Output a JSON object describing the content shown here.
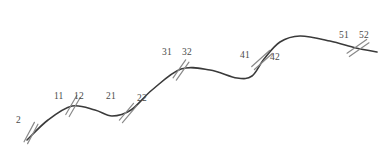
{
  "figure": {
    "type": "curve-diagram",
    "background_color": "#ffffff",
    "curve_color": "#3a3a3a",
    "tick_color": "#8a8a8a",
    "label_color": "#4a4a4a",
    "width": 387,
    "height": 161
  },
  "chart_data": {
    "type": "line",
    "title": "",
    "xlabel": "",
    "ylabel": "",
    "grid": false,
    "legend": null,
    "curve_points": [
      [
        27,
        140
      ],
      [
        48,
        120
      ],
      [
        72,
        106
      ],
      [
        95,
        110
      ],
      [
        112,
        116
      ],
      [
        131,
        110
      ],
      [
        152,
        90
      ],
      [
        181,
        69
      ],
      [
        210,
        70
      ],
      [
        237,
        78
      ],
      [
        252,
        76
      ],
      [
        264,
        59
      ],
      [
        280,
        42
      ],
      [
        300,
        36
      ],
      [
        330,
        41
      ],
      [
        356,
        48
      ],
      [
        377,
        52
      ]
    ],
    "tick_marks": [
      {
        "id": "tick-2",
        "x": 31,
        "y": 133,
        "angle_deg": 62,
        "length": 22,
        "pair_gap": 4
      },
      {
        "id": "tick-1x",
        "x": 73,
        "y": 106,
        "angle_deg": 60,
        "length": 22,
        "pair_gap": 4
      },
      {
        "id": "tick-2x",
        "x": 128,
        "y": 113,
        "angle_deg": 50,
        "length": 22,
        "pair_gap": 4
      },
      {
        "id": "tick-3x",
        "x": 181,
        "y": 70,
        "angle_deg": 55,
        "length": 22,
        "pair_gap": 4
      },
      {
        "id": "tick-4x",
        "x": 262,
        "y": 60,
        "angle_deg": 42,
        "length": 24,
        "pair_gap": 4
      },
      {
        "id": "tick-5x",
        "x": 358,
        "y": 48,
        "angle_deg": 35,
        "length": 24,
        "pair_gap": 4
      }
    ]
  },
  "labels": [
    {
      "id": "label-2",
      "text": "2",
      "x": 16,
      "y": 115
    },
    {
      "id": "label-11",
      "text": "11",
      "x": 54,
      "y": 91
    },
    {
      "id": "label-12",
      "text": "12",
      "x": 74,
      "y": 91
    },
    {
      "id": "label-21",
      "text": "21",
      "x": 106,
      "y": 91
    },
    {
      "id": "label-22",
      "text": "22",
      "x": 137,
      "y": 93
    },
    {
      "id": "label-31",
      "text": "31",
      "x": 162,
      "y": 47
    },
    {
      "id": "label-32",
      "text": "32",
      "x": 182,
      "y": 47
    },
    {
      "id": "label-41",
      "text": "41",
      "x": 240,
      "y": 50
    },
    {
      "id": "label-42",
      "text": "42",
      "x": 270,
      "y": 52
    },
    {
      "id": "label-51",
      "text": "51",
      "x": 339,
      "y": 30
    },
    {
      "id": "label-52",
      "text": "52",
      "x": 359,
      "y": 30
    }
  ]
}
